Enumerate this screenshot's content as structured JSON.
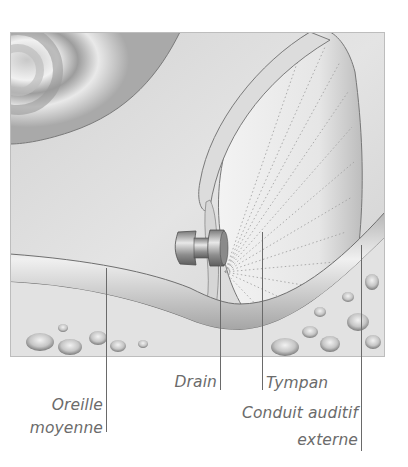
{
  "figure": {
    "palette": {
      "background": "#ffffff",
      "tissue_light": "#e9e9e9",
      "tissue_mid": "#c9c9c9",
      "tissue_dark": "#8a8a8a",
      "outline": "#6f6f6f",
      "label_text": "#6b6b6b",
      "leader_line": "#6a6a6a",
      "drain_metal": "#9a9a9a"
    }
  },
  "labels": {
    "middle_ear_line1": "Oreille",
    "middle_ear_line2": "moyenne",
    "drain": "Drain",
    "eardrum": "Tympan",
    "ear_canal_line1": "Conduit auditif",
    "ear_canal_line2": "externe"
  }
}
